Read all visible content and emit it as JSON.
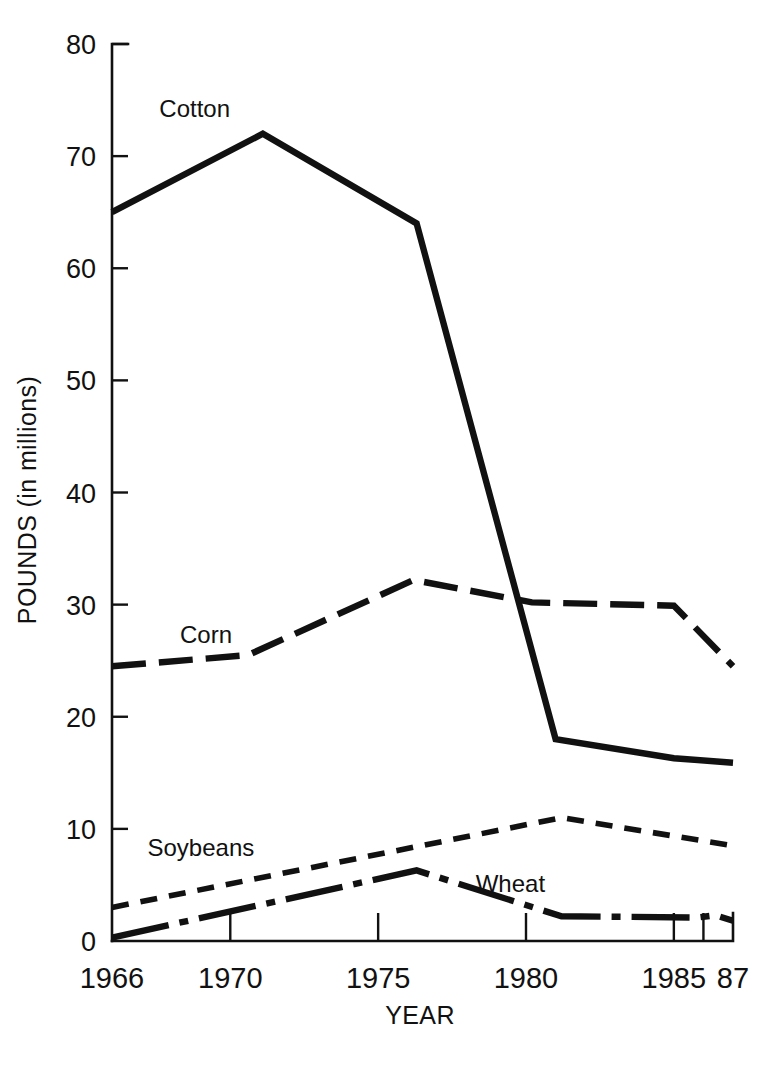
{
  "chart_data": {
    "type": "line",
    "title": "",
    "xlabel": "YEAR",
    "ylabel": "POUNDS (in millions)",
    "xlim": [
      1966,
      1987
    ],
    "ylim": [
      0,
      80
    ],
    "grid": false,
    "legend": "inline-labels",
    "y_ticks": [
      "0",
      "10",
      "20",
      "30",
      "40",
      "50",
      "60",
      "70",
      "80"
    ],
    "y_tick_values": [
      0,
      10,
      20,
      30,
      40,
      50,
      60,
      70,
      80
    ],
    "x_ticks": [
      "1966",
      "1970",
      "1975",
      "1980",
      "1985",
      "87"
    ],
    "x_tick_values": [
      1966,
      1970,
      1975,
      1980,
      1985,
      1987
    ],
    "series": [
      {
        "name": "Cotton",
        "style": "solid",
        "label_x": 1967.6,
        "label_y": 73.5,
        "x": [
          1966,
          1971.1,
          1976.3,
          1981,
          1985,
          1987
        ],
        "values": [
          65.0,
          72.0,
          64.0,
          18.0,
          16.3,
          15.9
        ]
      },
      {
        "name": "Corn",
        "style": "long-dash",
        "label_x": 1968.3,
        "label_y": 26.6,
        "x": [
          1966,
          1970.6,
          1976.2,
          1980.2,
          1985,
          1987
        ],
        "values": [
          24.5,
          25.5,
          32.2,
          30.2,
          29.9,
          24.5
        ]
      },
      {
        "name": "Soybeans",
        "style": "short-dash",
        "label_x": 1967.2,
        "label_y": 7.6,
        "x": [
          1966,
          1981.2,
          1987
        ],
        "values": [
          3.0,
          11.0,
          8.5
        ]
      },
      {
        "name": "Wheat",
        "style": "dash-dot",
        "label_x": 1978.3,
        "label_y": 4.4,
        "x": [
          1966,
          1976.3,
          1981.2,
          1985.8,
          1986.4,
          1987
        ],
        "values": [
          0.3,
          6.3,
          2.2,
          2.1,
          2.3,
          1.8
        ]
      }
    ]
  },
  "figure": {
    "y_axis_title": "POUNDS (in millions)",
    "x_axis_title": "YEAR"
  }
}
